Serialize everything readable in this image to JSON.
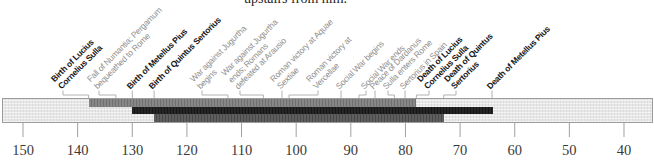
{
  "page": {
    "text_above_figure": "upstairs from him."
  },
  "chart_data": {
    "type": "timeline",
    "era": "BC",
    "x_axis": {
      "ticks": [
        150,
        140,
        130,
        120,
        110,
        100,
        90,
        80,
        70,
        60,
        50,
        40
      ],
      "direction": "years BC, decreasing left to right",
      "range": [
        150,
        40
      ]
    },
    "lifespans": [
      {
        "name": "Lucius Cornelius Sulla",
        "birth_year_bc": 138,
        "death_year_bc": 78
      },
      {
        "name": "Metellus Pius",
        "birth_year_bc": 130,
        "death_year_bc": 64
      },
      {
        "name": "Quintus Sertorius",
        "birth_year_bc": 126,
        "death_year_bc": 73
      }
    ],
    "events": [
      {
        "label": "Birth of Lucius Cornelius Sulla",
        "year_bc": 138,
        "emphasis": "bold"
      },
      {
        "label": "Fall of Numantia; Pergamum bequeathed to Rome",
        "year_bc": 133,
        "emphasis": "gray"
      },
      {
        "label": "Birth of Metellus Pius",
        "year_bc": 130,
        "emphasis": "bold"
      },
      {
        "label": "Birth of Quintus Sertorius",
        "year_bc": 126,
        "emphasis": "bold"
      },
      {
        "label": "War against Jugurtha begins",
        "year_bc": 112,
        "emphasis": "gray"
      },
      {
        "label": "War against Jugurtha ends; Romans defeated at Arausio",
        "year_bc": 106,
        "emphasis": "gray"
      },
      {
        "label": "Roman victory at Aquae Sextiae",
        "year_bc": 102,
        "emphasis": "gray"
      },
      {
        "label": "Roman victory at Vercellae",
        "year_bc": 101,
        "emphasis": "gray"
      },
      {
        "label": "Social War begins",
        "year_bc": 91,
        "emphasis": "gray"
      },
      {
        "label": "Social War ends",
        "year_bc": 88,
        "emphasis": "gray"
      },
      {
        "label": "Peace of Dardanus",
        "year_bc": 85,
        "emphasis": "gray"
      },
      {
        "label": "Sulla enters Rome",
        "year_bc": 82,
        "emphasis": "gray"
      },
      {
        "label": "Sertorius in Spain",
        "year_bc": 80,
        "emphasis": "gray"
      },
      {
        "label": "Death of Lucius Cornelius Sulla",
        "year_bc": 78,
        "emphasis": "bold"
      },
      {
        "label": "Death of Quintus Sertorius",
        "year_bc": 73,
        "emphasis": "bold"
      },
      {
        "label": "Death of Metellus Pius",
        "year_bc": 64,
        "emphasis": "bold"
      }
    ]
  },
  "render": {
    "axis": {
      "x0": 23,
      "px_per_year": 5.4636,
      "max_year": 150,
      "tick_years": [
        150,
        140,
        130,
        120,
        110,
        100,
        90,
        80,
        70,
        60,
        50,
        40
      ],
      "tick_top": 123,
      "tick_bottom": 137
    },
    "bars": [
      {
        "name": "sulla-lifespan-bar",
        "row": 0,
        "start_year": 138,
        "end_year": 78,
        "style": "medium"
      },
      {
        "name": "metellus-pius-lifespan-bar",
        "row": 1,
        "start_year": 130,
        "end_year": 64,
        "style": "dark"
      },
      {
        "name": "sertorius-lifespan-bar",
        "row": 2,
        "start_year": 126,
        "end_year": 73,
        "style": "gray"
      }
    ],
    "events": [
      {
        "lines": [
          "Birth of Lucius",
          "Cornelius Sulla"
        ],
        "bold": true,
        "label_x": 63,
        "anchor_year": 138
      },
      {
        "lines": [
          "Fall of Numantia; Pergamum",
          "bequeathed to Rome"
        ],
        "bold": false,
        "label_x": 99,
        "anchor_year": 133
      },
      {
        "lines": [
          "Birth of Metellus Pius"
        ],
        "bold": true,
        "label_x": 132.3,
        "anchor_year": 130
      },
      {
        "lines": [
          "Birth of Quintus Sertorius"
        ],
        "bold": true,
        "label_x": 154.1,
        "anchor_year": 126
      },
      {
        "lines": [
          "War against Jugurtha",
          "begins"
        ],
        "bold": false,
        "label_x": 202,
        "anchor_year": 112.5
      },
      {
        "lines": [
          "War against Jugurtha",
          "ends; Romans",
          "defeated at Arausio"
        ],
        "bold": false,
        "label_x": 240,
        "anchor_year": 106
      },
      {
        "lines": [
          "Roman victory at Aquae",
          "Sextiae"
        ],
        "bold": false,
        "label_x": 282,
        "anchor_year": 102.5
      },
      {
        "lines": [
          "Roman victory at",
          "Vercellae"
        ],
        "bold": false,
        "label_x": 318,
        "anchor_year": 101.3
      },
      {
        "lines": [
          "Social War begins"
        ],
        "bold": false,
        "label_x": 341,
        "anchor_year": 91.7
      },
      {
        "lines": [
          "Social War ends"
        ],
        "bold": false,
        "label_x": 366,
        "anchor_year": 88.5
      },
      {
        "lines": [
          "Peace of Dardanus"
        ],
        "bold": false,
        "label_x": 375,
        "anchor_year": 85.5
      },
      {
        "lines": [
          "Sulla enters Rome"
        ],
        "bold": false,
        "label_x": 388,
        "anchor_year": 82
      },
      {
        "lines": [
          "Sertorius in Spain"
        ],
        "bold": false,
        "label_x": 405,
        "anchor_year": 80
      },
      {
        "lines": [
          "Death of Lucius",
          "Cornelius Sulla"
        ],
        "bold": true,
        "label_x": 429,
        "anchor_year": 78
      },
      {
        "lines": [
          "Death of Quintus",
          "Sertorius"
        ],
        "bold": true,
        "label_x": 456,
        "anchor_year": 73
      },
      {
        "lines": [
          "Death of Metellus Pius"
        ],
        "bold": true,
        "label_x": 492,
        "anchor_year": 64.2
      }
    ],
    "colors": {
      "leader_line": "#b2b2b2",
      "tick_line": "#a0a0a0",
      "band_border": "#9c9c9c",
      "bold_label": "#161616",
      "gray_label": "#8f8f8f",
      "tick_text": "#3a3a3a"
    }
  }
}
